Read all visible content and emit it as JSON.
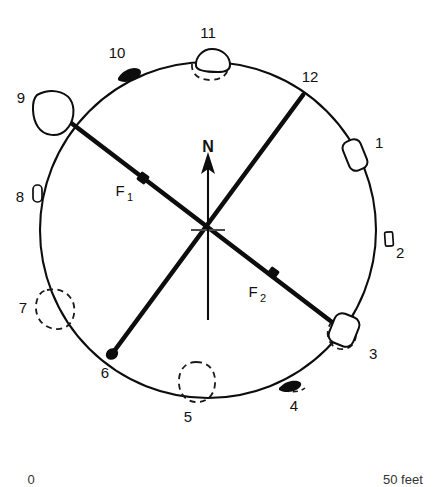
{
  "figure": {
    "type": "archaeological-site-plan",
    "shape": "circle",
    "north_label": "N"
  },
  "circle": {
    "cx": 208,
    "cy": 230,
    "r": 168
  },
  "center_marker": {
    "tick_half_width": 17
  },
  "north_arrow": {
    "label": "N",
    "label_x": 208,
    "label_y": 152,
    "tip_x": 208,
    "tip_y": 158,
    "tail_x": 208,
    "tail_y": 320
  },
  "chords": [
    {
      "name": "F1",
      "label": "F",
      "subscript": "1",
      "label_x": 120,
      "label_y": 196,
      "sub_x": 132,
      "sub_y": 201,
      "from_feature": "9",
      "to_feature": "3",
      "x1": 62,
      "y1": 116,
      "x2": 345,
      "y2": 332,
      "dot_x": 143,
      "dot_y": 178,
      "dot_r": 4.6
    },
    {
      "name": "F2",
      "label": "F",
      "subscript": "2",
      "label_x": 253,
      "label_y": 297,
      "sub_x": 265,
      "sub_y": 302,
      "from_feature": "12",
      "to_feature": "6",
      "x1": 303,
      "y1": 95,
      "x2": 112,
      "y2": 354,
      "dot_x": 273,
      "dot_y": 273,
      "dot_r": 4.6
    }
  ],
  "features": [
    {
      "id": "1",
      "label": "1",
      "label_x": 375,
      "label_y": 148,
      "marker": "rounded-rect-outline",
      "x": 355,
      "y": 155,
      "w": 19,
      "h": 31,
      "rotation": -22,
      "style": "solid"
    },
    {
      "id": "2",
      "label": "2",
      "label_x": 396,
      "label_y": 258,
      "marker": "small-rect-outline",
      "x": 389,
      "y": 239,
      "w": 8,
      "h": 14,
      "rotation": -4,
      "style": "solid"
    },
    {
      "id": "3",
      "label": "3",
      "label_x": 369,
      "label_y": 359,
      "marker": "rounded-rect-outline-with-dashed",
      "x": 344,
      "y": 330,
      "w": 26,
      "h": 31,
      "rotation": 22,
      "style": "solid-and-dashed"
    },
    {
      "id": "4",
      "label": "4",
      "label_x": 294,
      "label_y": 411,
      "marker": "small-blob",
      "x": 287,
      "y": 386,
      "w": 17,
      "h": 9,
      "rotation": -24,
      "style": "solid"
    },
    {
      "id": "5",
      "label": "5",
      "label_x": 188,
      "label_y": 422,
      "marker": "dashed-oval",
      "x": 196,
      "y": 379,
      "w": 36,
      "h": 33,
      "rotation": 0,
      "style": "dashed"
    },
    {
      "id": "6",
      "label": "6",
      "label_x": 105,
      "label_y": 378,
      "marker": "chord-endpoint-dot",
      "x": 112,
      "y": 354,
      "w": 10,
      "h": 10,
      "rotation": 0,
      "style": "solid"
    },
    {
      "id": "7",
      "label": "7",
      "label_x": 23,
      "label_y": 313,
      "marker": "dashed-blob",
      "x": 46,
      "y": 305,
      "w": 35,
      "h": 37,
      "rotation": 0,
      "style": "dashed"
    },
    {
      "id": "8",
      "label": "8",
      "label_x": 20,
      "label_y": 202,
      "marker": "narrow-oval-outline",
      "x": 37,
      "y": 193,
      "w": 9,
      "h": 17,
      "rotation": 0,
      "style": "solid"
    },
    {
      "id": "9",
      "label": "9",
      "label_x": 21,
      "label_y": 103,
      "marker": "rounded-quad-outline",
      "x": 52,
      "y": 109,
      "w": 28,
      "h": 33,
      "rotation": 18,
      "style": "solid"
    },
    {
      "id": "10",
      "label": "10",
      "label_x": 117,
      "label_y": 58,
      "marker": "small-blob",
      "x": 126,
      "y": 73,
      "w": 16,
      "h": 9,
      "rotation": 24,
      "style": "solid"
    },
    {
      "id": "11",
      "label": "11",
      "label_x": 208,
      "label_y": 38,
      "marker": "rounded-quad-with-dashed",
      "x": 209,
      "y": 58,
      "w": 32,
      "h": 23,
      "rotation": 0,
      "style": "solid-and-dashed"
    },
    {
      "id": "12",
      "label": "12",
      "label_x": 310,
      "label_y": 82,
      "marker": "chord-endpoint",
      "x": 303,
      "y": 95,
      "w": 0,
      "h": 0,
      "rotation": 0,
      "style": "none"
    }
  ],
  "scale_bar": {
    "left_label": "0",
    "right_label": "50 feet",
    "left_x": 31,
    "right_x": 383,
    "y": 481
  }
}
